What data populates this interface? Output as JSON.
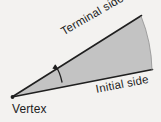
{
  "figure": {
    "background_color": "#f3f2f0",
    "sector_fill_color": "#c3c3c3",
    "stroke_color": "#1f1f1f",
    "labels": {
      "vertex": "Vertex",
      "terminal_side": "Terminal side",
      "initial_side": "Initial side"
    },
    "icons": {
      "angle_arc": "angle-arc-arrow-icon"
    },
    "geometry": {
      "vertex_point": [
        12,
        97
      ],
      "terminal_end_point": [
        141,
        16
      ],
      "initial_end_point": [
        152,
        70
      ],
      "arc_sweep_note": "rotation arrow from initial side counterclockwise to terminal side"
    }
  }
}
